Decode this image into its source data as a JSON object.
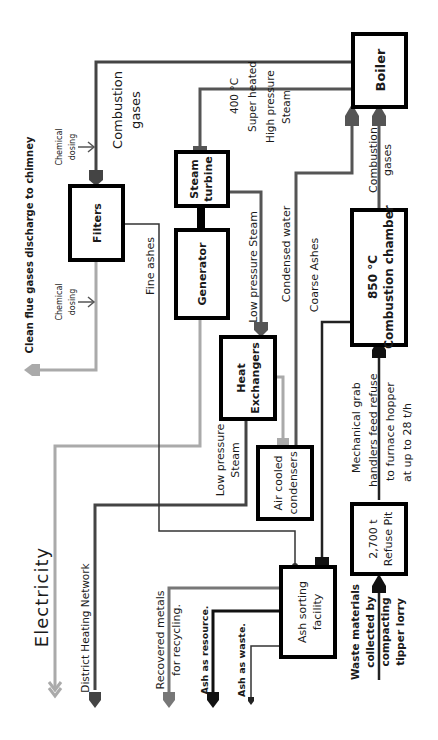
{
  "colors": {
    "dark_line": "#444444",
    "black": "#000000",
    "light_gray_line": "#a6a6a6",
    "mid_gray_line": "#666666",
    "thin_line": "#333333"
  },
  "nodes": {
    "boiler": {
      "label": "Boiler"
    },
    "steam_turbine": {
      "line1": "Steam",
      "line2": "turbine"
    },
    "generator": {
      "label": "Generator"
    },
    "filters": {
      "label": "Filters"
    },
    "heat_exchangers": {
      "line1": "Heat",
      "line2": "Exchangers"
    },
    "air_cooled_condensers": {
      "line1": "Air cooled",
      "line2": "condensers"
    },
    "combustion_chamber": {
      "line1": "850 °C",
      "line2": "Combustion chamber"
    },
    "refuse_pit": {
      "line1": "2,700 t",
      "line2": "Refuse Pit"
    },
    "ash_sorting": {
      "line1": "Ash sorting",
      "line2": "facility"
    }
  },
  "labels": {
    "combustion_gases_top": {
      "line1": "Combustion",
      "line2": "gases"
    },
    "combustion_gases_boiler": {
      "line1": "Combustion",
      "line2": "gases"
    },
    "steam_hp": {
      "line1": "400 °C",
      "line2": "Super heated",
      "line3": "High pressure",
      "line4": "Steam"
    },
    "chemical_dosing_1": {
      "line1": "Chemical",
      "line2": "dosing"
    },
    "chemical_dosing_2": {
      "line1": "Chemical",
      "line2": "dosing"
    },
    "clean_flue": "Clean flue gases discharge to chimney",
    "fine_ashes": "Fine ashes",
    "low_pressure_steam_turbine": "Low pressure Steam",
    "condensed_water": "Condensed water",
    "coarse_ashes": "Coarse Ashes",
    "low_pressure_steam_he": {
      "line1": "Low pressure",
      "line2": "Steam"
    },
    "mechanical_grab": {
      "line1": "Mechanical grab",
      "line2": "handlers feed refuse",
      "line3": "to furnace hopper",
      "line4": "at up to 28 t/h"
    },
    "electricity": "Electricity",
    "district_heating": "District Heating Network",
    "recovered_metals": {
      "line1": "Recovered metals",
      "line2": "for recycling."
    },
    "ash_resource": "Ash as resource.",
    "ash_waste": "Ash as waste.",
    "waste_materials": {
      "line1": "Waste materials",
      "line2": "collected by",
      "line3": "compacting",
      "line4": "tipper lorry"
    }
  }
}
